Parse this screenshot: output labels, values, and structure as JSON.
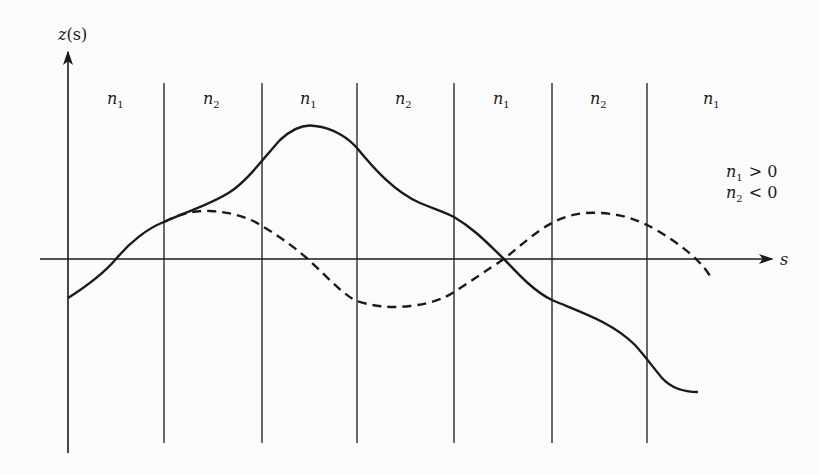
{
  "diagram": {
    "axes": {
      "y_label_main": "z",
      "y_label_paren": "(s)",
      "x_label": "s"
    },
    "regions": [
      {
        "sym": "n",
        "sub": "1"
      },
      {
        "sym": "n",
        "sub": "2"
      },
      {
        "sym": "n",
        "sub": "1"
      },
      {
        "sym": "n",
        "sub": "2"
      },
      {
        "sym": "n",
        "sub": "1"
      },
      {
        "sym": "n",
        "sub": "2"
      },
      {
        "sym": "n",
        "sub": "1"
      }
    ],
    "legend": [
      {
        "sym": "n",
        "sub": "1",
        "relation": "> 0"
      },
      {
        "sym": "n",
        "sub": "2",
        "relation": "< 0"
      }
    ],
    "curves": [
      {
        "name": "solid",
        "style": "solid"
      },
      {
        "name": "dashed",
        "style": "dashed"
      }
    ],
    "colors": {
      "ink": "#1a1a1a",
      "background": "#fbfbfb"
    }
  }
}
